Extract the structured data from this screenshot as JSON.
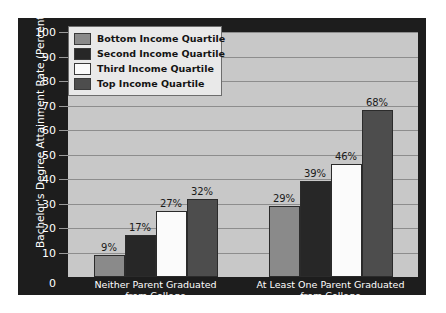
{
  "chart_data": {
    "type": "bar",
    "title": "",
    "xlabel": "",
    "ylabel": "Bachelor's Degree Attainment Rate (Percent)",
    "ylim": [
      0,
      100
    ],
    "ytick_step": 10,
    "grid": true,
    "legend_position": "top-left-inside",
    "categories": [
      "Neither Parent Graduated from College",
      "At Least One Parent Graduated from College"
    ],
    "category_lines": [
      [
        "Neither Parent Graduated",
        "from College"
      ],
      [
        "At Least One Parent Graduated",
        "from College"
      ]
    ],
    "yticks": [
      "0",
      "10",
      "20",
      "30",
      "40",
      "50",
      "60",
      "70",
      "80",
      "90",
      "100"
    ],
    "series": [
      {
        "name": "Bottom Income Quartile",
        "color": "#8a8a8a",
        "values": [
          9,
          29
        ],
        "labels": [
          "9%",
          "29%"
        ]
      },
      {
        "name": "Second Income Quartile",
        "color": "#272727",
        "values": [
          17,
          39
        ],
        "labels": [
          "17%",
          "39%"
        ]
      },
      {
        "name": "Third Income Quartile",
        "color": "#fbfbfb",
        "values": [
          27,
          46
        ],
        "labels": [
          "27%",
          "46%"
        ]
      },
      {
        "name": "Top Income Quartile",
        "color": "#4d4d4d",
        "values": [
          32,
          68
        ],
        "labels": [
          "32%",
          "68%"
        ]
      }
    ],
    "colors": {
      "figure_background": "#1d1d1d",
      "plot_background": "#c8c8c8",
      "gridline": "#8d8d8d",
      "axis_text": "#ffffff",
      "value_label": "#1a1a1a",
      "legend_background": "#e9e9e9",
      "legend_border": "#6d6d6d"
    }
  }
}
